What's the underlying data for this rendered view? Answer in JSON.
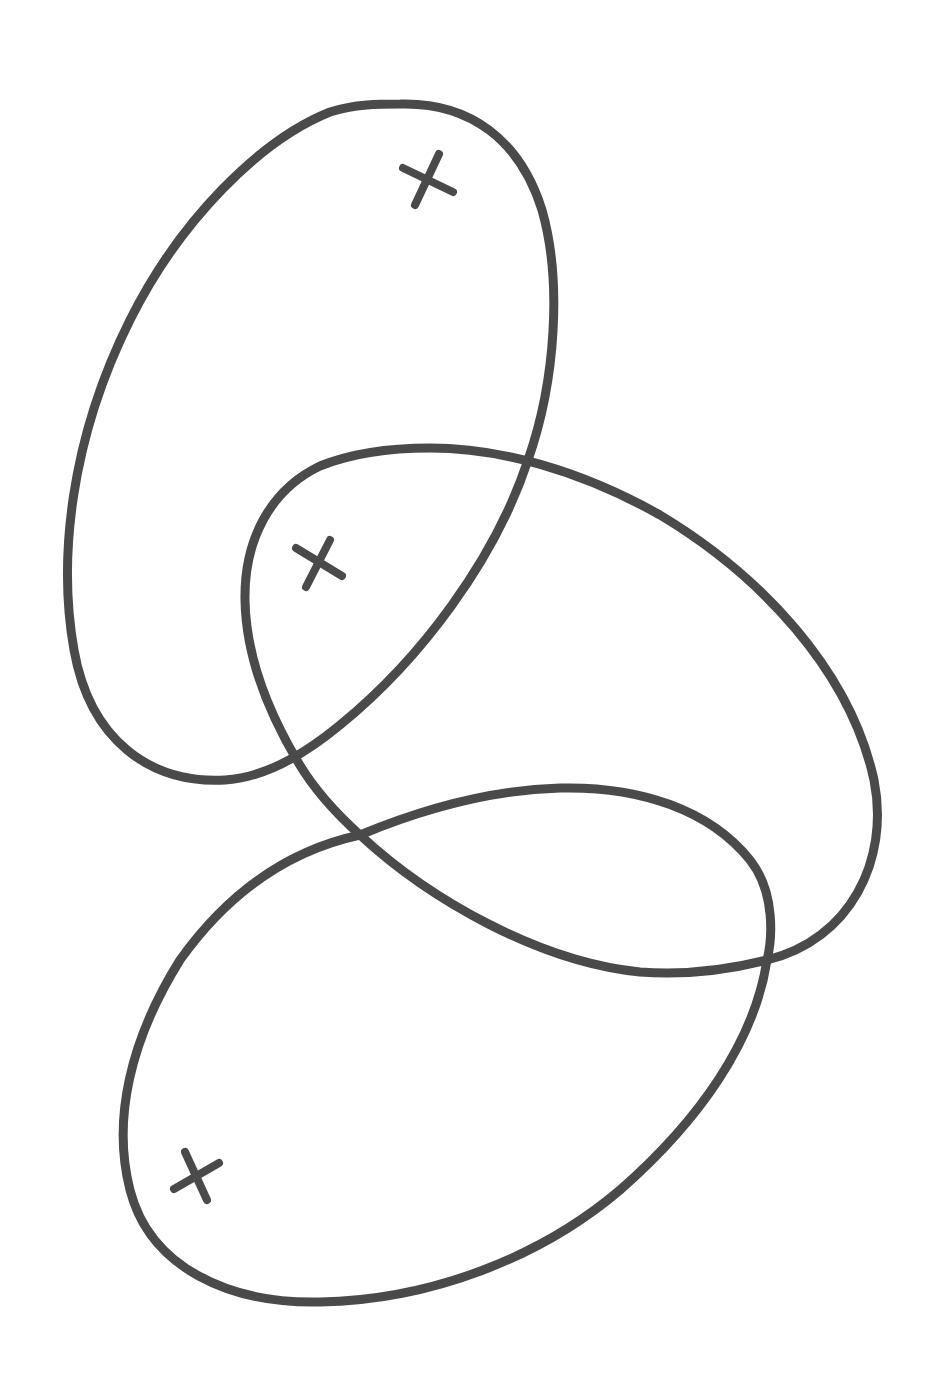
{
  "diagram": {
    "background": "#ffffff",
    "stroke_color": "#4a4a4a",
    "stroke_width": 9,
    "shapes": [
      {
        "id": "top-loop",
        "kind": "closed-curve",
        "marker": {
          "symbol": "×",
          "x": 427,
          "y": 180
        }
      },
      {
        "id": "middle-loop",
        "kind": "closed-curve",
        "marker": {
          "symbol": "×",
          "x": 318,
          "y": 565
        }
      },
      {
        "id": "bottom-loop",
        "kind": "closed-curve",
        "marker": {
          "symbol": "×",
          "x": 197,
          "y": 1173
        }
      }
    ],
    "intersections": [
      {
        "between": [
          "top-loop",
          "middle-loop"
        ],
        "x": 528,
        "y": 460
      },
      {
        "between": [
          "top-loop",
          "middle-loop"
        ],
        "x": 298,
        "y": 762
      },
      {
        "between": [
          "middle-loop",
          "bottom-loop"
        ],
        "x": 360,
        "y": 835
      },
      {
        "between": [
          "middle-loop",
          "bottom-loop"
        ],
        "x": 767,
        "y": 960
      }
    ]
  }
}
